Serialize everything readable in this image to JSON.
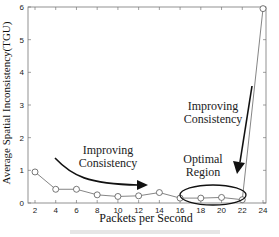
{
  "chart_data": {
    "type": "line",
    "title": "",
    "xlabel": "Packets per Second",
    "ylabel": "Average Spatial Inconsistency(TGU)",
    "x": [
      2,
      4,
      6,
      8,
      10,
      12,
      14,
      16,
      18,
      20,
      22,
      24
    ],
    "series": [
      {
        "name": "Average Spatial Inconsistency",
        "values": [
          0.95,
          0.42,
          0.42,
          0.25,
          0.2,
          0.22,
          0.32,
          0.15,
          0.15,
          0.17,
          0.1,
          5.95
        ],
        "marker": "circle",
        "color": "#555555"
      }
    ],
    "xlim": [
      1,
      25
    ],
    "ylim": [
      0,
      6
    ],
    "xticks": [
      2,
      4,
      6,
      8,
      10,
      12,
      14,
      16,
      18,
      20,
      22,
      24
    ],
    "yticks": [
      0,
      1,
      2,
      3,
      4,
      5,
      6
    ],
    "grid": false,
    "legend": null,
    "annotations": [
      {
        "text": [
          "Improving",
          "Consistency"
        ],
        "arrow": "curved arrow pointing right toward lower-middle x-range"
      },
      {
        "text": [
          "Improving",
          "Consistency"
        ],
        "arrow": "arrow pointing down toward optimal region"
      },
      {
        "text": [
          "Optimal",
          "Region"
        ],
        "shape": "ellipse around x=18 to x=22"
      }
    ]
  },
  "labels": {
    "xlabel": "Packets per Second",
    "ylabel": "Average Spatial Inconsistency(TGU)",
    "anno1_line1": "Improving",
    "anno1_line2": "Consistency",
    "anno2_line1": "Improving",
    "anno2_line2": "Consistency",
    "anno3_line1": "Optimal",
    "anno3_line2": "Region"
  }
}
